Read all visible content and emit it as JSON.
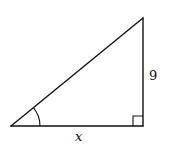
{
  "diagram": {
    "type": "right-triangle",
    "stroke_color": "#111111",
    "background": "#ffffff",
    "vertices": {
      "acute_left": [
        11,
        126
      ],
      "right_angle": [
        143,
        126
      ],
      "top": [
        143,
        18
      ]
    },
    "labels": {
      "vertical_leg": "9",
      "horizontal_leg": "x"
    },
    "markers": {
      "right_angle": "square at bottom-right vertex",
      "angle_arc": "arc marking acute angle at bottom-left vertex"
    }
  }
}
